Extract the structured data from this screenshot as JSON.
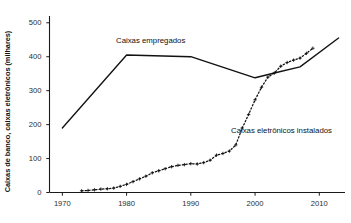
{
  "chart_data": {
    "type": "line",
    "title": "",
    "xlabel": "",
    "ylabel": "Caixas de banco, caixas eletrônicos (milhares)",
    "xlim": [
      1968,
      2014
    ],
    "ylim": [
      0,
      520
    ],
    "grid": false,
    "legend_position": "inline-annotation",
    "x_ticks": [
      "1970",
      "1980",
      "1990",
      "2000",
      "2010"
    ],
    "x_tick_values": [
      1970,
      1980,
      1990,
      2000,
      2010
    ],
    "y_ticks": [
      "0",
      "100",
      "200",
      "300",
      "400",
      "500"
    ],
    "y_tick_values": [
      0,
      100,
      200,
      300,
      400,
      500
    ],
    "series": [
      {
        "name": "Caixas empregados",
        "style": "solid",
        "marker": "none",
        "color": "#111111",
        "annotation": "Caixas empregados",
        "points": [
          [
            1970,
            190
          ],
          [
            1980,
            405
          ],
          [
            1990,
            400
          ],
          [
            2000,
            338
          ],
          [
            2003,
            352
          ],
          [
            2007,
            370
          ],
          [
            2013,
            455
          ]
        ]
      },
      {
        "name": "Caixas eletrônicos instalados",
        "style": "dotted",
        "marker": "plus",
        "color": "#111111",
        "annotation": "Caixas eletrônicos instalados",
        "points": [
          [
            1973,
            5
          ],
          [
            1974,
            6
          ],
          [
            1975,
            8
          ],
          [
            1976,
            10
          ],
          [
            1977,
            11
          ],
          [
            1978,
            13
          ],
          [
            1979,
            18
          ],
          [
            1980,
            24
          ],
          [
            1981,
            32
          ],
          [
            1982,
            40
          ],
          [
            1983,
            48
          ],
          [
            1984,
            58
          ],
          [
            1985,
            64
          ],
          [
            1986,
            70
          ],
          [
            1987,
            76
          ],
          [
            1988,
            80
          ],
          [
            1989,
            82
          ],
          [
            1990,
            85
          ],
          [
            1991,
            84
          ],
          [
            1992,
            88
          ],
          [
            1993,
            95
          ],
          [
            1994,
            110
          ],
          [
            1995,
            115
          ],
          [
            1996,
            122
          ],
          [
            1997,
            140
          ],
          [
            1998,
            190
          ],
          [
            1999,
            230
          ],
          [
            2000,
            273
          ],
          [
            2001,
            310
          ],
          [
            2002,
            340
          ],
          [
            2003,
            352
          ],
          [
            2004,
            372
          ],
          [
            2005,
            383
          ],
          [
            2006,
            390
          ],
          [
            2007,
            396
          ],
          [
            2008,
            410
          ],
          [
            2009,
            425
          ]
        ]
      }
    ]
  },
  "axes": {
    "y_title": "Caixas de banco, caixas eletrônicos (milhares)"
  },
  "annotations": {
    "employed": "Caixas empregados",
    "atm": "Caixas eletrônicos instalados"
  }
}
